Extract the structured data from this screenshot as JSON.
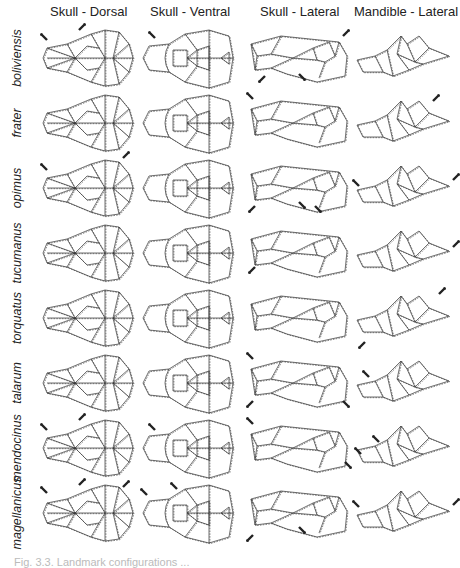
{
  "figure": {
    "column_headers": [
      "Skull - Dorsal",
      "Skull - Ventral",
      "Skull - Lateral",
      "Mandible - Lateral"
    ],
    "caption_partial": "Fig. 3.3. Landmark configurations ...",
    "line_color": "#333333",
    "consensus_style": "solid",
    "species_style": "dashed",
    "arrow_color": "#222222",
    "rows": [
      {
        "species": "boliviensis",
        "arrows": {
          "dorsal": [
            [
              -1,
              -1,
              8,
              14
            ],
            [
              1,
              -1,
              40,
              4
            ]
          ],
          "ventral": [
            [
              -1,
              -1,
              16,
              12
            ]
          ],
          "lateral": [
            [
              1,
              -1,
              96,
              10
            ],
            [
              -1,
              1,
              18,
              50
            ],
            [
              1,
              1,
              52,
              48
            ]
          ],
          "mandible": []
        }
      },
      {
        "species": "frater",
        "arrows": {
          "dorsal": [],
          "ventral": [],
          "lateral": [
            [
              -1,
              -1,
              6,
              8
            ]
          ],
          "mandible": [
            [
              1,
              -1,
              80,
              10
            ]
          ]
        }
      },
      {
        "species": "opimus",
        "arrows": {
          "dorsal": [
            [
              -1,
              -1,
              8,
              14
            ],
            [
              1,
              -1,
              84,
              2
            ]
          ],
          "ventral": [],
          "lateral": [
            [
              -1,
              1,
              8,
              50
            ],
            [
              1,
              1,
              52,
              46
            ],
            [
              1,
              1,
              68,
              50
            ]
          ],
          "mandible": [
            [
              -1,
              -1,
              6,
              30
            ],
            [
              1,
              -1,
              100,
              24
            ]
          ]
        }
      },
      {
        "species": "tucumanus",
        "arrows": {
          "dorsal": [],
          "ventral": [],
          "lateral": [
            [
              -1,
              1,
              8,
              46
            ]
          ],
          "mandible": [
            [
              1,
              -1,
              100,
              26
            ]
          ]
        }
      },
      {
        "species": "torquatus",
        "arrows": {
          "dorsal": [],
          "ventral": [],
          "lateral": [],
          "mandible": [
            [
              1,
              -1,
              86,
              8
            ],
            [
              -1,
              1,
              12,
              56
            ]
          ]
        }
      },
      {
        "species": "talarum",
        "arrows": {
          "dorsal": [],
          "ventral": [],
          "lateral": [
            [
              -1,
              -1,
              6,
              8
            ],
            [
              -1,
              1,
              6,
              50
            ],
            [
              1,
              1,
              96,
              50
            ]
          ],
          "mandible": [
            [
              -1,
              -1,
              16,
              26
            ]
          ]
        }
      },
      {
        "species": "mendocinus",
        "arrows": {
          "dorsal": [
            [
              -1,
              -1,
              8,
              14
            ],
            [
              1,
              -1,
              40,
              4
            ]
          ],
          "ventral": [
            [
              -1,
              -1,
              16,
              14
            ]
          ],
          "lateral": [
            [
              -1,
              -1,
              6,
              8
            ],
            [
              1,
              1,
              98,
              46
            ]
          ],
          "mandible": [
            [
              -1,
              -1,
              8,
              38
            ],
            [
              -1,
              -1,
              26,
              26
            ]
          ]
        }
      },
      {
        "species": "magellanicus",
        "arrows": {
          "dorsal": [
            [
              -1,
              -1,
              8,
              12
            ],
            [
              1,
              -1,
              40,
              4
            ],
            [
              1,
              -1,
              84,
              6
            ]
          ],
          "ventral": [
            [
              -1,
              -1,
              8,
              14
            ],
            [
              -1,
              -1,
              38,
              8
            ]
          ],
          "lateral": [
            [
              -1,
              1,
              6,
              54
            ],
            [
              1,
              1,
              52,
              46
            ]
          ],
          "mandible": [
            [
              -1,
              -1,
              6,
              26
            ],
            [
              1,
              -1,
              100,
              24
            ]
          ]
        }
      }
    ]
  }
}
